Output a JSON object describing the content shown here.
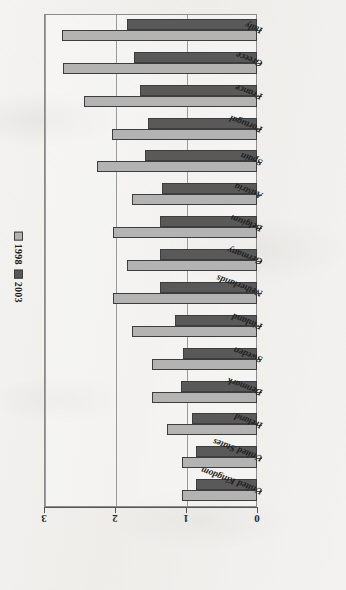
{
  "chart_data": {
    "type": "bar",
    "orientation": "horizontal",
    "title": "",
    "xlabel": "",
    "ylabel": "",
    "xlim": [
      0,
      3
    ],
    "xticks": [
      0,
      1,
      2,
      3
    ],
    "grid": true,
    "legend_position": "left",
    "categories": [
      "Italy",
      "Greece",
      "France",
      "Portugal",
      "Spain",
      "Austria",
      "Belgium",
      "Germany",
      "Netherlands",
      "Finland",
      "Sweden",
      "Denmark",
      "Ireland",
      "United States",
      "United Kingdom"
    ],
    "series": [
      {
        "name": "1998",
        "color": "#b3b3b3",
        "values": [
          2.75,
          2.73,
          2.44,
          2.04,
          2.25,
          1.76,
          2.03,
          1.83,
          2.03,
          1.76,
          1.48,
          1.48,
          1.27,
          1.06,
          1.06
        ]
      },
      {
        "name": "2003",
        "color": "#595959",
        "values": [
          1.83,
          1.73,
          1.65,
          1.54,
          1.58,
          1.34,
          1.37,
          1.37,
          1.37,
          1.16,
          1.04,
          1.07,
          0.92,
          0.86,
          0.86
        ]
      }
    ]
  },
  "legend": {
    "items": [
      {
        "label": "1998",
        "color": "#b3b3b3"
      },
      {
        "label": "2003",
        "color": "#595959"
      }
    ]
  },
  "axis": {
    "tick_labels": [
      "3",
      "2",
      "1",
      "0"
    ]
  },
  "colors": {
    "series_1998": "#b3b3b3",
    "series_2003": "#595959",
    "frame": "#8c8c8c",
    "gridline": "#9a9a9a",
    "bar_outline": "#3d3d3d",
    "background": "#f2f1ef"
  }
}
